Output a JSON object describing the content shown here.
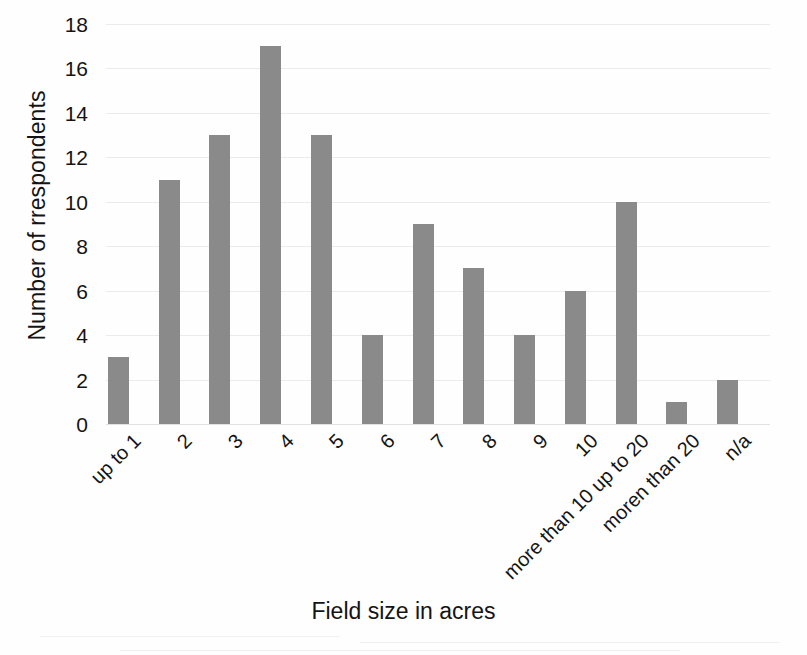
{
  "chart_data": {
    "type": "bar",
    "title": "",
    "xlabel": "Field size in acres",
    "ylabel": "Number of rrespondents",
    "categories": [
      "up to 1",
      "2",
      "3",
      "4",
      "5",
      "6",
      "7",
      "8",
      "9",
      "10",
      "more than 10 up to 20",
      "moren than 20",
      "n/a"
    ],
    "values": [
      3,
      11,
      13,
      17,
      13,
      4,
      9,
      7,
      4,
      6,
      10,
      1,
      2
    ],
    "ylim": [
      0,
      18
    ],
    "ytick_values": [
      0,
      2,
      4,
      6,
      8,
      10,
      12,
      14,
      16,
      18
    ],
    "ytick_labels": [
      "0",
      "2",
      "4",
      "6",
      "8",
      "10",
      "12",
      "14",
      "16",
      "18"
    ],
    "ystep": 2,
    "grid": true,
    "legend": false,
    "bar_color": "#8a8a8a",
    "grid_color": "#eceaea",
    "text_color": "#141414",
    "background": "#fefefe",
    "xtick_rotation_deg": -45
  }
}
